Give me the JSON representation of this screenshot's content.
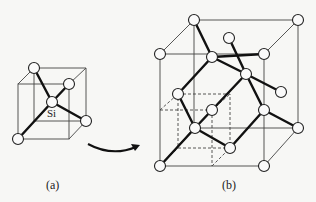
{
  "figure": {
    "panel_a": {
      "label": "(a)",
      "atom_label": "Si"
    },
    "panel_b": {
      "label": "(b)"
    },
    "arrow": "curved-arrow-a-to-b"
  }
}
